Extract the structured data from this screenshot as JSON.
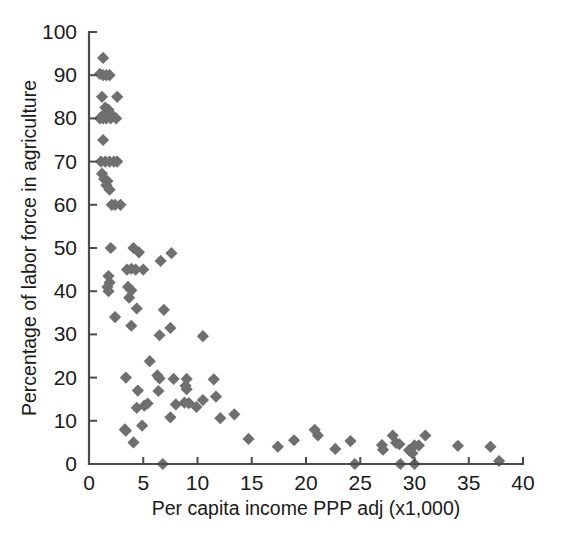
{
  "chart_data": {
    "type": "scatter",
    "title": "",
    "xlabel": "Per capita income PPP adj (x1,000)",
    "ylabel": "Percentage of labor force in agriculture",
    "xlim": [
      0,
      40
    ],
    "ylim": [
      0,
      100
    ],
    "xticks": [
      0,
      5,
      10,
      15,
      20,
      25,
      30,
      35,
      40
    ],
    "yticks": [
      0,
      10,
      20,
      30,
      40,
      50,
      60,
      70,
      80,
      90,
      100
    ],
    "xtick_labels": [
      "0",
      "5",
      "10",
      "15",
      "20",
      "25",
      "30",
      "35",
      "40"
    ],
    "ytick_labels": [
      "0",
      "10",
      "20",
      "30",
      "40",
      "50",
      "60",
      "70",
      "80",
      "90",
      "100"
    ],
    "grid": false,
    "legend": null,
    "marker": {
      "shape": "diamond",
      "color": "#6f6f6f",
      "size": 9
    },
    "series": [
      {
        "name": "Countries",
        "points": [
          [
            1.3,
            94.0
          ],
          [
            1.0,
            90.3
          ],
          [
            1.3,
            90.0
          ],
          [
            1.6,
            90.0
          ],
          [
            1.9,
            90.0
          ],
          [
            1.2,
            85.0
          ],
          [
            2.6,
            85.0
          ],
          [
            1.5,
            82.5
          ],
          [
            1.8,
            82.0
          ],
          [
            1.4,
            81.0
          ],
          [
            1.7,
            80.8
          ],
          [
            1.0,
            80.0
          ],
          [
            1.3,
            80.0
          ],
          [
            1.6,
            80.0
          ],
          [
            2.0,
            80.0
          ],
          [
            2.2,
            80.6
          ],
          [
            2.5,
            80.0
          ],
          [
            1.3,
            75.0
          ],
          [
            1.1,
            70.0
          ],
          [
            1.5,
            70.0
          ],
          [
            1.9,
            70.0
          ],
          [
            2.3,
            70.0
          ],
          [
            2.6,
            70.0
          ],
          [
            1.2,
            67.2
          ],
          [
            1.4,
            66.0
          ],
          [
            1.7,
            65.5
          ],
          [
            1.6,
            64.5
          ],
          [
            1.9,
            63.5
          ],
          [
            2.1,
            60.0
          ],
          [
            2.4,
            60.0
          ],
          [
            2.9,
            60.0
          ],
          [
            2.0,
            50.0
          ],
          [
            4.1,
            50.0
          ],
          [
            4.6,
            49.0
          ],
          [
            7.6,
            48.8
          ],
          [
            6.6,
            47.0
          ],
          [
            3.5,
            45.0
          ],
          [
            3.9,
            45.2
          ],
          [
            4.3,
            45.0
          ],
          [
            5.0,
            45.0
          ],
          [
            1.8,
            43.5
          ],
          [
            1.9,
            42.0
          ],
          [
            1.7,
            41.0
          ],
          [
            3.6,
            41.0
          ],
          [
            1.8,
            40.0
          ],
          [
            3.9,
            40.2
          ],
          [
            3.7,
            38.5
          ],
          [
            4.4,
            36.0
          ],
          [
            6.9,
            35.7
          ],
          [
            2.4,
            34.0
          ],
          [
            7.5,
            31.5
          ],
          [
            3.9,
            32.0
          ],
          [
            6.5,
            29.8
          ],
          [
            10.5,
            29.6
          ],
          [
            5.6,
            23.8
          ],
          [
            3.4,
            20.0
          ],
          [
            6.3,
            20.5
          ],
          [
            6.5,
            19.8
          ],
          [
            7.8,
            19.7
          ],
          [
            9.0,
            19.7
          ],
          [
            11.5,
            19.6
          ],
          [
            8.9,
            18.1
          ],
          [
            9.0,
            17.3
          ],
          [
            4.5,
            17.0
          ],
          [
            6.4,
            16.9
          ],
          [
            11.7,
            15.6
          ],
          [
            10.5,
            14.8
          ],
          [
            5.4,
            14.0
          ],
          [
            8.0,
            13.8
          ],
          [
            8.8,
            14.2
          ],
          [
            9.2,
            14.1
          ],
          [
            4.4,
            13.0
          ],
          [
            5.1,
            13.5
          ],
          [
            9.9,
            13.2
          ],
          [
            7.5,
            10.8
          ],
          [
            12.1,
            10.6
          ],
          [
            13.4,
            11.5
          ],
          [
            4.9,
            8.9
          ],
          [
            3.3,
            8.0
          ],
          [
            3.4,
            7.7
          ],
          [
            14.7,
            5.8
          ],
          [
            17.4,
            4.0
          ],
          [
            4.1,
            5.0
          ],
          [
            20.8,
            7.9
          ],
          [
            21.1,
            6.6
          ],
          [
            18.9,
            5.5
          ],
          [
            22.7,
            3.5
          ],
          [
            24.1,
            5.3
          ],
          [
            27.0,
            4.4
          ],
          [
            27.1,
            3.3
          ],
          [
            28.0,
            6.6
          ],
          [
            28.3,
            4.9
          ],
          [
            28.6,
            4.6
          ],
          [
            29.5,
            3.2
          ],
          [
            29.8,
            2.5
          ],
          [
            30.0,
            4.3
          ],
          [
            30.4,
            4.3
          ],
          [
            31.0,
            6.6
          ],
          [
            34.0,
            4.2
          ],
          [
            37.0,
            4.0
          ],
          [
            6.8,
            0.0
          ],
          [
            24.5,
            0.0
          ],
          [
            28.7,
            0.0
          ],
          [
            30.0,
            0.0
          ],
          [
            37.8,
            0.7
          ]
        ]
      }
    ]
  }
}
